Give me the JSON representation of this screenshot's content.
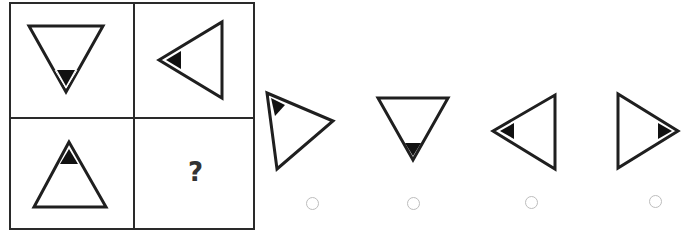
{
  "puzzle": {
    "question_mark": "?",
    "cells": [
      {
        "position": "top-left",
        "shape": "triangle",
        "pointing": "down",
        "marker_corner": "bottom"
      },
      {
        "position": "top-right",
        "shape": "triangle",
        "pointing": "left",
        "marker_corner": "left"
      },
      {
        "position": "bottom-left",
        "shape": "triangle",
        "pointing": "up",
        "marker_corner": "top"
      },
      {
        "position": "bottom-right",
        "shape": "unknown",
        "content": "?"
      }
    ]
  },
  "options": [
    {
      "index": 1,
      "shape": "triangle",
      "pointing": "right-rotated",
      "marker_corner": "top-left",
      "selected": false
    },
    {
      "index": 2,
      "shape": "triangle",
      "pointing": "down",
      "marker_corner": "bottom",
      "selected": false
    },
    {
      "index": 3,
      "shape": "triangle",
      "pointing": "left",
      "marker_corner": "left",
      "selected": false
    },
    {
      "index": 4,
      "shape": "triangle",
      "pointing": "right",
      "marker_corner": "right",
      "selected": false
    }
  ],
  "colors": {
    "stroke": "#1f1f1f",
    "marker": "#111111",
    "radio_border": "#bdbdbd",
    "background": "#ffffff"
  }
}
